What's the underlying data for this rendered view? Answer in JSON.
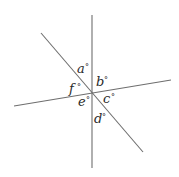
{
  "diagram": {
    "lines": [
      {
        "name": "vertical-line",
        "x1": 92,
        "y1": 15,
        "x2": 92,
        "y2": 168
      },
      {
        "name": "diagonal-line",
        "x1": 41,
        "y1": 33,
        "x2": 143,
        "y2": 152
      },
      {
        "name": "horizontal-line",
        "x1": 14,
        "y1": 106,
        "x2": 171,
        "y2": 80
      }
    ],
    "intersection": {
      "x": 92,
      "y": 94
    },
    "labels": [
      {
        "id": "a",
        "text": "a",
        "degree": "°",
        "x": 77,
        "y": 73
      },
      {
        "id": "b",
        "text": "b",
        "degree": "°",
        "x": 96,
        "y": 86
      },
      {
        "id": "c",
        "text": "c",
        "degree": "°",
        "x": 103,
        "y": 103
      },
      {
        "id": "d",
        "text": "d",
        "degree": "°",
        "x": 94,
        "y": 123
      },
      {
        "id": "e",
        "text": "e",
        "degree": "°",
        "x": 78,
        "y": 106
      },
      {
        "id": "f",
        "text": "f",
        "degree": "°",
        "x": 69,
        "y": 93
      }
    ],
    "colors": {
      "line": "#6e6e6e",
      "text": "#2a2a2a",
      "background": "#ffffff"
    }
  }
}
